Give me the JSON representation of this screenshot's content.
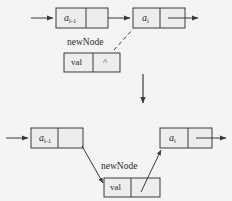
{
  "figure": {
    "background_color": "#f4f4f4",
    "line_color": "#3a3a3a",
    "box_fill": "#ededed",
    "width": 232,
    "height": 201
  },
  "top_diagram": {
    "name": "before-insertion",
    "nodes": [
      {
        "id": "node-a-prev-top",
        "label": "a",
        "subscript": "i-1",
        "data_cell_text": "a",
        "next_cell_text": ""
      },
      {
        "id": "node-a-i-top",
        "label": "a",
        "subscript": "i",
        "data_cell_text": "a",
        "next_cell_text": ""
      }
    ],
    "new_node": {
      "id": "new-node-top",
      "name_label": "newNode",
      "value_cell_text": "val",
      "next_cell_text": "^"
    },
    "incoming_arrow": "from-left",
    "outgoing_arrow": "to-right",
    "dashed_pointer": "newNode-next-toward-a-i"
  },
  "transition": {
    "name": "down-arrow",
    "direction": "down"
  },
  "bottom_diagram": {
    "name": "after-insertion",
    "nodes": [
      {
        "id": "node-a-prev-bottom",
        "label": "a",
        "subscript": "i-1",
        "data_cell_text": "a",
        "next_cell_text": ""
      },
      {
        "id": "node-a-i-bottom",
        "label": "a",
        "subscript": "i",
        "data_cell_text": "a",
        "next_cell_text": ""
      }
    ],
    "new_node": {
      "id": "new-node-bottom",
      "name_label": "newNode",
      "value_cell_text": "val",
      "next_cell_text": ""
    },
    "incoming_arrow": "from-left",
    "outgoing_arrow": "to-right",
    "pointer_prev_to_new": "a-i-1-next-to-newNode",
    "pointer_new_to_next": "newNode-next-to-a-i"
  }
}
